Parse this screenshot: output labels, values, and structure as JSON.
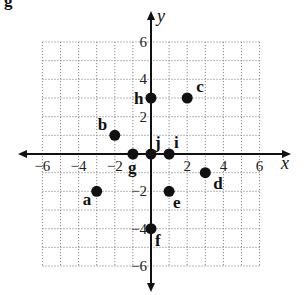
{
  "chart_data": {
    "type": "scatter",
    "title": "",
    "xlabel": "x",
    "ylabel": "y",
    "xlim": [
      -6,
      6
    ],
    "ylim": [
      -6,
      6
    ],
    "grid": true,
    "grid_style": "dotted",
    "x_ticks": [
      -6,
      -4,
      -2,
      2,
      4,
      6
    ],
    "y_ticks": [
      6,
      4,
      2,
      -2,
      -4,
      -6
    ],
    "x_tick_labels": [
      "−6",
      "−4",
      "−2",
      "2",
      "4",
      "6"
    ],
    "y_tick_labels": [
      "6",
      "4",
      "2",
      "−2",
      "−4",
      "−6"
    ],
    "points": [
      {
        "label": "a",
        "x": -3,
        "y": -2
      },
      {
        "label": "b",
        "x": -2,
        "y": 1
      },
      {
        "label": "c",
        "x": 2,
        "y": 3
      },
      {
        "label": "d",
        "x": 3,
        "y": -1
      },
      {
        "label": "e",
        "x": 1,
        "y": -2
      },
      {
        "label": "f",
        "x": 0,
        "y": -4
      },
      {
        "label": "g",
        "x": -1,
        "y": 0
      },
      {
        "label": "h",
        "x": 0,
        "y": 3
      },
      {
        "label": "i",
        "x": 1,
        "y": 0
      },
      {
        "label": "j",
        "x": 0,
        "y": 0
      }
    ],
    "legend": null
  },
  "header": {
    "cut_off_text": "g"
  },
  "colors": {
    "axis": "#111111",
    "grid": "#888888",
    "point": "#111111",
    "background": "#ffffff"
  }
}
